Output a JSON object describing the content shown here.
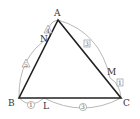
{
  "diagram": {
    "type": "triangle-ratio",
    "vertices": {
      "A": {
        "label": "A",
        "x": 58,
        "y": 20
      },
      "B": {
        "label": "B",
        "x": 19,
        "y": 98
      },
      "C": {
        "label": "C",
        "x": 121,
        "y": 98
      }
    },
    "points": {
      "L": {
        "label": "L",
        "on": "BC"
      },
      "M": {
        "label": "M",
        "on": "CA"
      },
      "N": {
        "label": "N",
        "on": "AB"
      }
    },
    "ratios": {
      "BL": {
        "value": "1",
        "marker": "circle"
      },
      "LC": {
        "value": "3",
        "marker": "circle"
      },
      "CM": {
        "value": "1",
        "marker": "square"
      },
      "MA": {
        "value": "3",
        "marker": "square"
      },
      "AN": {
        "value": "4",
        "marker": "triangle"
      },
      "NB": {
        "value": "5",
        "marker": "triangle"
      }
    },
    "colors": {
      "triangle": "#222222",
      "arc": "#999999",
      "text": "#333333"
    }
  }
}
